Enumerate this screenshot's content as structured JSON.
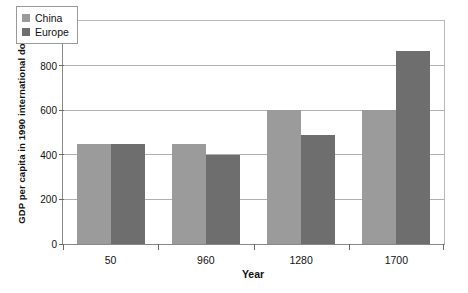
{
  "chart_data": {
    "type": "bar",
    "title": "",
    "xlabel": "Year",
    "ylabel": "GDP per capita in 1990 international dollars",
    "categories": [
      "50",
      "960",
      "1280",
      "1700"
    ],
    "series": [
      {
        "name": "China",
        "color": "#9b9b9b",
        "values": [
          450,
          450,
          600,
          600
        ]
      },
      {
        "name": "Europe",
        "color": "#6e6e6e",
        "values": [
          450,
          400,
          490,
          865
        ]
      }
    ],
    "ylim": [
      0,
      1000
    ],
    "yticks": [
      0,
      200,
      400,
      600,
      800,
      1000
    ],
    "ytick_labels": [
      "0",
      "200",
      "400",
      "600",
      "800",
      "1,000"
    ],
    "grid": true,
    "legend_position": "top-left"
  },
  "legend": {
    "items": [
      {
        "label": "China"
      },
      {
        "label": "Europe"
      }
    ]
  },
  "axes": {
    "y_title": "GDP per capita in 1990 international dollars",
    "x_title": "Year"
  }
}
